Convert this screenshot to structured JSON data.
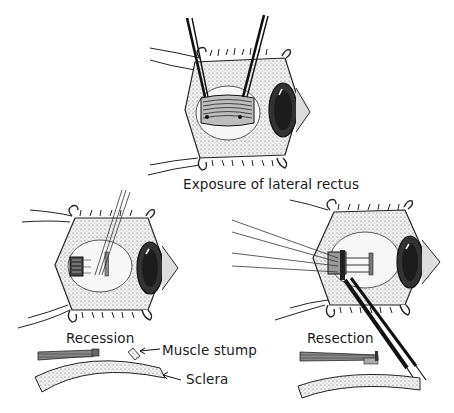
{
  "figure": {
    "panels": [
      {
        "id": "top",
        "caption": "Exposure of lateral rectus"
      },
      {
        "id": "left",
        "caption": "Recession"
      },
      {
        "id": "right",
        "caption": "Resection"
      }
    ],
    "callouts": {
      "muscle_stump": "Muscle stump",
      "sclera": "Sclera"
    }
  }
}
